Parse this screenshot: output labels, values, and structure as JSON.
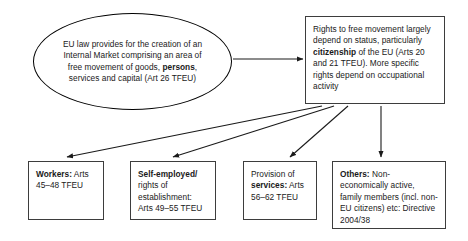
{
  "diagram": {
    "colors": {
      "stroke": "#000000",
      "box_stroke": "#3d3d3d",
      "text": "#1a1a1a",
      "background": "#ffffff"
    },
    "source_node": {
      "id": "internal-market",
      "shape": "ellipse",
      "text_parts": [
        {
          "text": "EU law provides for the creation of an Internal Market comprising an area of free movement of goods, ",
          "bold": false
        },
        {
          "text": "persons",
          "bold": true
        },
        {
          "text": ", services and capital (Art 26 TFEU)",
          "bold": false
        }
      ]
    },
    "rights_node": {
      "id": "rights-to-free-movement",
      "shape": "rectangle",
      "text_parts": [
        {
          "text": "Rights to free movement largely depend on status, particularly ",
          "bold": false
        },
        {
          "text": "citizenship",
          "bold": true
        },
        {
          "text": " of the EU (Arts 20 and 21 TFEU). More specific rights depend on occupational activity",
          "bold": false
        }
      ]
    },
    "category_nodes": [
      {
        "id": "workers",
        "shape": "rectangle",
        "text_parts": [
          {
            "text": "Workers:",
            "bold": true
          },
          {
            "text": " Arts 45–48 TFEU",
            "bold": false
          }
        ]
      },
      {
        "id": "self-employed",
        "shape": "rectangle",
        "text_parts": [
          {
            "text": "Self-employed/",
            "bold": true
          },
          {
            "text": " rights of establishment: Arts 49–55 TFEU",
            "bold": false
          }
        ]
      },
      {
        "id": "provision-of-services",
        "shape": "rectangle",
        "text_parts": [
          {
            "text": "Provision of ",
            "bold": false
          },
          {
            "text": "services:",
            "bold": true
          },
          {
            "text": " Arts 56–62 TFEU",
            "bold": false
          }
        ]
      },
      {
        "id": "others",
        "shape": "rectangle",
        "text_parts": [
          {
            "text": "Others:",
            "bold": true
          },
          {
            "text": " Non-economically active, family members (incl. non-EU citizens) etc: Directive 2004/38",
            "bold": false
          }
        ]
      }
    ],
    "connectors": [
      {
        "id": "internal-market-to-rights",
        "from": "internal-market",
        "to": "rights-to-free-movement",
        "style": "arrow"
      },
      {
        "id": "rights-to-workers",
        "from": "rights-to-free-movement",
        "to": "workers",
        "style": "arrow"
      },
      {
        "id": "rights-to-self-employed",
        "from": "rights-to-free-movement",
        "to": "self-employed",
        "style": "arrow"
      },
      {
        "id": "rights-to-services",
        "from": "rights-to-free-movement",
        "to": "provision-of-services",
        "style": "arrow"
      },
      {
        "id": "rights-to-others",
        "from": "rights-to-free-movement",
        "to": "others",
        "style": "arrow"
      }
    ]
  }
}
